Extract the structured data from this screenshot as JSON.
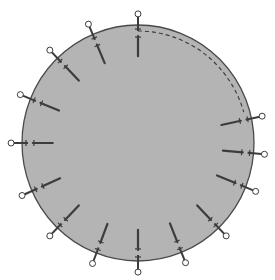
{
  "diagram": {
    "colors": {
      "background": "#ffffff",
      "fabric_fill": "#b4b4b4",
      "fabric_edge": "#4a4a4a",
      "pin": "#3c3c3c",
      "pin_head_fill": "#ffffff",
      "dashed_line": "#3a3a3a"
    },
    "circle": {
      "cx": 138,
      "cy": 143,
      "rx": 116,
      "ry": 118
    },
    "dashed_line": {
      "start_angle_deg": -90,
      "end_angle_deg": -16,
      "inset": 6
    },
    "pins_angle_deg": [
      -90,
      -113,
      -134,
      -158,
      180,
      156,
      134,
      111,
      90,
      68,
      46,
      22,
      5,
      -12
    ]
  }
}
